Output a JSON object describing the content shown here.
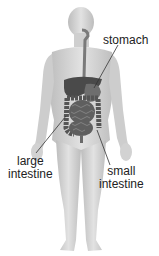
{
  "diagram": {
    "colors": {
      "body_fill": "#d9d9d9",
      "body_shade": "#b8b8b8",
      "liver": "#4a4a4a",
      "stomach": "#6e6e6e",
      "intestine": "#5a5a5a",
      "esophagus": "#7a7a7a",
      "leader_line": "#333333",
      "text": "#222222"
    },
    "labels": {
      "stomach": {
        "line1": "stomach"
      },
      "large_intestine": {
        "line1": "large",
        "line2": "intestine"
      },
      "small_intestine": {
        "line1": "small",
        "line2": "intestine"
      }
    }
  }
}
